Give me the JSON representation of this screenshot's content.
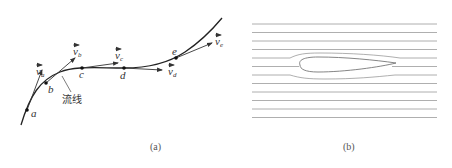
{
  "panel_a": {
    "caption": "(a)",
    "streamline_label": "流线",
    "points": [
      {
        "id": "a",
        "label": "a",
        "x": 27,
        "y": 110,
        "lx": 31,
        "ly": 117
      },
      {
        "id": "b",
        "label": "b",
        "x": 46,
        "y": 83,
        "lx": 48,
        "ly": 93
      },
      {
        "id": "c",
        "label": "c",
        "x": 82,
        "y": 68,
        "lx": 79,
        "ly": 78
      },
      {
        "id": "d",
        "label": "d",
        "x": 124,
        "y": 68,
        "lx": 120,
        "ly": 79
      },
      {
        "id": "e",
        "label": "e",
        "x": 176,
        "y": 58,
        "lx": 172,
        "ly": 55
      }
    ],
    "vectors": [
      {
        "id": "va",
        "base": "v",
        "sub": "a",
        "x1": 27,
        "y1": 110,
        "x2": 42,
        "y2": 70,
        "lx": 36,
        "ly": 75
      },
      {
        "id": "vb",
        "base": "v",
        "sub": "b",
        "x1": 46,
        "y1": 83,
        "x2": 75,
        "y2": 58,
        "lx": 73,
        "ly": 55
      },
      {
        "id": "vc",
        "base": "v",
        "sub": "c",
        "x1": 82,
        "y1": 68,
        "x2": 118,
        "y2": 63,
        "lx": 115,
        "ly": 59
      },
      {
        "id": "vd",
        "base": "v",
        "sub": "d",
        "x1": 124,
        "y1": 68,
        "x2": 162,
        "y2": 70,
        "lx": 168,
        "ly": 75
      },
      {
        "id": "ve",
        "base": "v",
        "sub": "e",
        "x1": 176,
        "y1": 58,
        "x2": 212,
        "y2": 43,
        "lx": 215,
        "ly": 45
      }
    ],
    "colors": {
      "curve": "#222222",
      "vector": "#333333",
      "text": "#333333"
    }
  },
  "panel_b": {
    "caption": "(b)",
    "line_count": 12,
    "colors": {
      "line": "#9a9a9a",
      "airfoil": "#777777"
    }
  }
}
